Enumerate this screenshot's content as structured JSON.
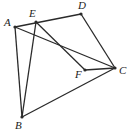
{
  "diagram": {
    "type": "geometry",
    "points": [
      {
        "name": "A",
        "x": 15,
        "y": 27,
        "lx": 4,
        "ly": 26
      },
      {
        "name": "E",
        "x": 36,
        "y": 22,
        "lx": 29,
        "ly": 17
      },
      {
        "name": "D",
        "x": 81,
        "y": 14,
        "lx": 78,
        "ly": 9
      },
      {
        "name": "C",
        "x": 115,
        "y": 68,
        "lx": 119,
        "ly": 74
      },
      {
        "name": "F",
        "x": 85,
        "y": 70,
        "lx": 75,
        "ly": 78
      },
      {
        "name": "B",
        "x": 22,
        "y": 117,
        "lx": 15,
        "ly": 129
      }
    ],
    "segments": [
      [
        "A",
        "D"
      ],
      [
        "A",
        "C"
      ],
      [
        "A",
        "B"
      ],
      [
        "E",
        "B"
      ],
      [
        "E",
        "F"
      ],
      [
        "F",
        "C"
      ],
      [
        "D",
        "C"
      ],
      [
        "B",
        "C"
      ]
    ]
  }
}
